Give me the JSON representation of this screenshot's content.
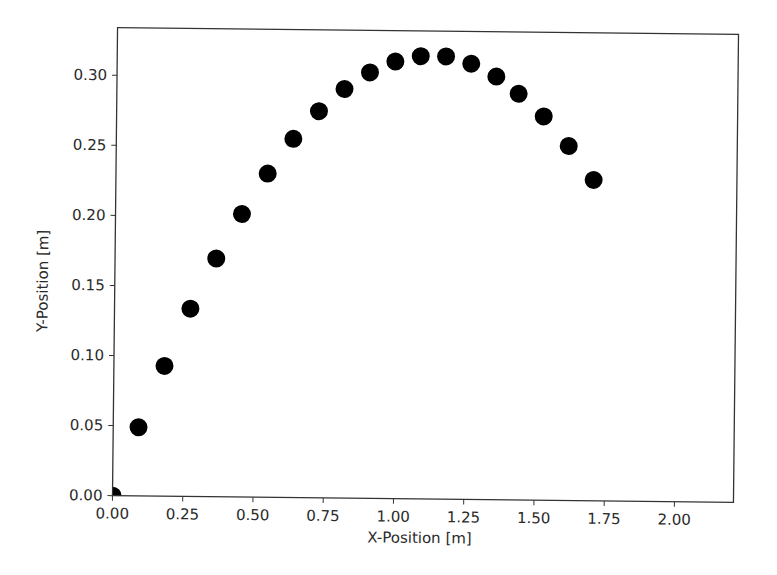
{
  "chart_data": {
    "type": "scatter",
    "title": "",
    "xlabel": "X-Position [m]",
    "ylabel": "Y-Position [m]",
    "xlim": [
      0.0,
      2.21
    ],
    "ylim": [
      0.0,
      0.334
    ],
    "grid": false,
    "legend": null,
    "x_ticks": [
      "0.00",
      "0.25",
      "0.50",
      "0.75",
      "1.00",
      "1.25",
      "1.50",
      "1.75",
      "2.00"
    ],
    "x_tick_values": [
      0.0,
      0.25,
      0.5,
      0.75,
      1.0,
      1.25,
      1.5,
      1.75,
      2.0
    ],
    "y_ticks": [
      "0.00",
      "0.05",
      "0.10",
      "0.15",
      "0.20",
      "0.25",
      "0.30"
    ],
    "y_tick_values": [
      0.0,
      0.05,
      0.1,
      0.15,
      0.2,
      0.25,
      0.3
    ],
    "marker_color": "#000000",
    "series": [
      {
        "name": "trajectory",
        "x": [
          0.0,
          0.09,
          0.18,
          0.27,
          0.36,
          0.45,
          0.54,
          0.63,
          0.72,
          0.81,
          0.9,
          0.99,
          1.08,
          1.17,
          1.26,
          1.35,
          1.43,
          1.52,
          1.61,
          1.7
        ],
        "y": [
          0.0,
          0.049,
          0.093,
          0.134,
          0.17,
          0.202,
          0.231,
          0.256,
          0.276,
          0.292,
          0.304,
          0.312,
          0.316,
          0.316,
          0.311,
          0.302,
          0.29,
          0.274,
          0.253,
          0.229
        ]
      }
    ]
  }
}
